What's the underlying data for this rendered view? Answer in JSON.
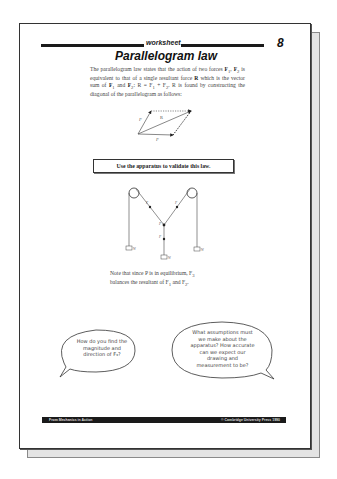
{
  "worksheet": {
    "header_label": "worksheet",
    "page_number": "8",
    "title": "Parallelogram law",
    "intro": {
      "part1": "The parallelogram law states that the action of two forces ",
      "forces": "F",
      "part2": "1",
      "part3": ", ",
      "part4": "F",
      "part5": "2",
      "part6": " is equivalent to that of a single resultant force ",
      "resultant": "R",
      "part7": " which is the vector sum of ",
      "f1": "F",
      "f1sub": "1",
      "and": " and ",
      "f2": "F",
      "f2sub": "2",
      "eq": ": R = F",
      "eq1": "1",
      "plus": " + F",
      "eq2": "2",
      "part8": ". R is found by constructing the diagonal of the parallelogram as follows:"
    },
    "parallelogram_diagram": {
      "labels": [
        "F1",
        "R",
        "F2"
      ]
    },
    "instruction": "Use the apparatus to validate this law.",
    "apparatus_diagram": {
      "labels": [
        "F1",
        "F2",
        "P",
        "F3",
        "W1",
        "W3",
        "W2"
      ]
    },
    "note": {
      "line1": "Note that since P is in equilibrium, F",
      "sub3": "3",
      "line2": "balances the resultant of F",
      "sub1": "1",
      "and": " and F",
      "sub2": "2",
      "end": "."
    },
    "bubbles": [
      {
        "text": "How do you find the magnitude and direction of F₃?"
      },
      {
        "text": "What assumptions must we make about the apparatus? How accurate can we expect our drawing and measurement to be?"
      }
    ],
    "footer": {
      "left": "From Mechanics in Action",
      "right": "© Cambridge University Press 1990"
    }
  }
}
